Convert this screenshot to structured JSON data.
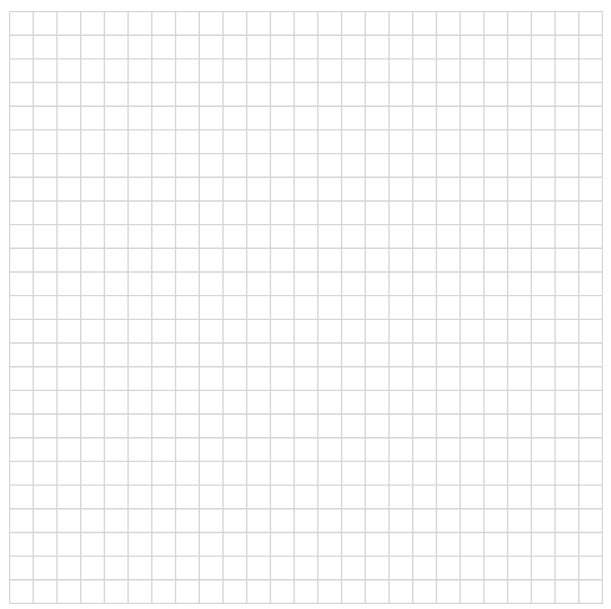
{
  "grid": {
    "columns": 25,
    "rows": 25,
    "line_color": "#d6d6d6",
    "background": "#ffffff"
  }
}
